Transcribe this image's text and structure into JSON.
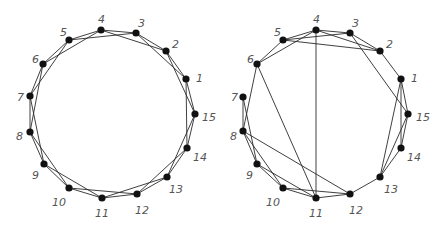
{
  "figure": {
    "graphs": [
      {
        "name": "left-graph",
        "nodes": [
          {
            "id": "1",
            "x": 186,
            "y": 79,
            "lx": 196,
            "ly": 79
          },
          {
            "id": "2",
            "x": 166,
            "y": 51,
            "lx": 172,
            "ly": 45
          },
          {
            "id": "3",
            "x": 136,
            "y": 33,
            "lx": 138,
            "ly": 24
          },
          {
            "id": "4",
            "x": 101,
            "y": 30,
            "lx": 98,
            "ly": 20
          },
          {
            "id": "5",
            "x": 69,
            "y": 40,
            "lx": 60,
            "ly": 33
          },
          {
            "id": "6",
            "x": 43,
            "y": 64,
            "lx": 32,
            "ly": 60
          },
          {
            "id": "7",
            "x": 30,
            "y": 96,
            "lx": 17,
            "ly": 98
          },
          {
            "id": "8",
            "x": 30,
            "y": 132,
            "lx": 16,
            "ly": 137
          },
          {
            "id": "9",
            "x": 44,
            "y": 164,
            "lx": 32,
            "ly": 176
          },
          {
            "id": "10",
            "x": 69,
            "y": 188,
            "lx": 52,
            "ly": 203
          },
          {
            "id": "11",
            "x": 102,
            "y": 198,
            "lx": 95,
            "ly": 214
          },
          {
            "id": "12",
            "x": 137,
            "y": 194,
            "lx": 135,
            "ly": 211
          },
          {
            "id": "13",
            "x": 167,
            "y": 177,
            "lx": 169,
            "ly": 190
          },
          {
            "id": "14",
            "x": 187,
            "y": 148,
            "lx": 193,
            "ly": 158
          },
          {
            "id": "15",
            "x": 195,
            "y": 114,
            "lx": 202,
            "ly": 118
          }
        ],
        "edges": [
          [
            "1",
            "2"
          ],
          [
            "2",
            "3"
          ],
          [
            "3",
            "4"
          ],
          [
            "4",
            "5"
          ],
          [
            "5",
            "6"
          ],
          [
            "6",
            "7"
          ],
          [
            "7",
            "8"
          ],
          [
            "8",
            "9"
          ],
          [
            "9",
            "10"
          ],
          [
            "10",
            "11"
          ],
          [
            "11",
            "12"
          ],
          [
            "12",
            "13"
          ],
          [
            "13",
            "14"
          ],
          [
            "14",
            "15"
          ],
          [
            "15",
            "1"
          ],
          [
            "1",
            "3"
          ],
          [
            "2",
            "4"
          ],
          [
            "3",
            "5"
          ],
          [
            "4",
            "6"
          ],
          [
            "5",
            "7"
          ],
          [
            "6",
            "8"
          ],
          [
            "7",
            "9"
          ],
          [
            "8",
            "10"
          ],
          [
            "9",
            "11"
          ],
          [
            "10",
            "12"
          ],
          [
            "11",
            "13"
          ],
          [
            "12",
            "14"
          ],
          [
            "13",
            "15"
          ],
          [
            "14",
            "1"
          ],
          [
            "15",
            "2"
          ]
        ]
      },
      {
        "name": "right-graph",
        "nodes": [
          {
            "id": "1",
            "x": 401,
            "y": 79,
            "lx": 411,
            "ly": 79
          },
          {
            "id": "2",
            "x": 380,
            "y": 51,
            "lx": 386,
            "ly": 45
          },
          {
            "id": "3",
            "x": 350,
            "y": 33,
            "lx": 352,
            "ly": 24
          },
          {
            "id": "4",
            "x": 316,
            "y": 30,
            "lx": 313,
            "ly": 20
          },
          {
            "id": "5",
            "x": 283,
            "y": 40,
            "lx": 274,
            "ly": 33
          },
          {
            "id": "6",
            "x": 257,
            "y": 64,
            "lx": 247,
            "ly": 60
          },
          {
            "id": "7",
            "x": 243,
            "y": 97,
            "lx": 231,
            "ly": 98
          },
          {
            "id": "8",
            "x": 243,
            "y": 131,
            "lx": 230,
            "ly": 137
          },
          {
            "id": "9",
            "x": 257,
            "y": 164,
            "lx": 246,
            "ly": 176
          },
          {
            "id": "10",
            "x": 283,
            "y": 188,
            "lx": 266,
            "ly": 203
          },
          {
            "id": "11",
            "x": 316,
            "y": 198,
            "lx": 309,
            "ly": 214
          },
          {
            "id": "12",
            "x": 350,
            "y": 194,
            "lx": 349,
            "ly": 211
          },
          {
            "id": "13",
            "x": 380,
            "y": 177,
            "lx": 384,
            "ly": 190
          },
          {
            "id": "14",
            "x": 401,
            "y": 148,
            "lx": 407,
            "ly": 158
          },
          {
            "id": "15",
            "x": 408,
            "y": 114,
            "lx": 416,
            "ly": 118
          }
        ],
        "edges": [
          [
            "4",
            "5"
          ],
          [
            "4",
            "6"
          ],
          [
            "4",
            "3"
          ],
          [
            "4",
            "2"
          ],
          [
            "4",
            "11"
          ],
          [
            "5",
            "6"
          ],
          [
            "5",
            "3"
          ],
          [
            "5",
            "2"
          ],
          [
            "3",
            "2"
          ],
          [
            "3",
            "15"
          ],
          [
            "2",
            "1"
          ],
          [
            "1",
            "15"
          ],
          [
            "1",
            "14"
          ],
          [
            "1",
            "13"
          ],
          [
            "15",
            "14"
          ],
          [
            "15",
            "13"
          ],
          [
            "14",
            "13"
          ],
          [
            "13",
            "12"
          ],
          [
            "12",
            "11"
          ],
          [
            "12",
            "10"
          ],
          [
            "12",
            "8"
          ],
          [
            "11",
            "10"
          ],
          [
            "11",
            "9"
          ],
          [
            "11",
            "6"
          ],
          [
            "10",
            "9"
          ],
          [
            "10",
            "8"
          ],
          [
            "9",
            "8"
          ],
          [
            "9",
            "7"
          ],
          [
            "8",
            "7"
          ],
          [
            "8",
            "6"
          ]
        ]
      }
    ]
  }
}
